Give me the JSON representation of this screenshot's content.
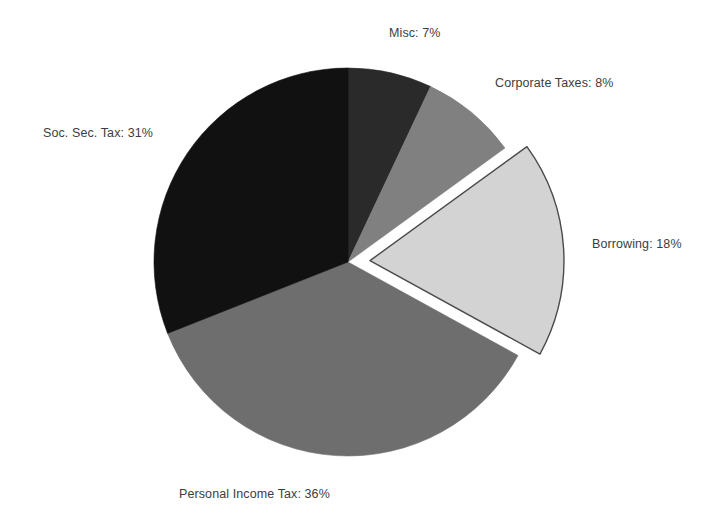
{
  "chart_data": {
    "type": "pie",
    "title": "",
    "xlabel": "",
    "ylabel": "",
    "legend_position": "none",
    "grid": false,
    "labels": [
      "Misc",
      "Corporate Taxes",
      "Borrowing",
      "Personal Income Tax",
      "Soc. Sec. Tax"
    ],
    "values": [
      7,
      8,
      18,
      36,
      31
    ],
    "unit": "%",
    "start_angle_deg": 0,
    "direction": "clockwise",
    "exploded_slices": [
      "Borrowing"
    ],
    "colors": [
      "#2a2a2a",
      "#808080",
      "#d3d3d3",
      "#6e6e6e",
      "#111111"
    ],
    "slices": [
      {
        "name": "Misc",
        "value": 7,
        "label": "Misc: 7%",
        "color": "#2a2a2a",
        "exploded": false
      },
      {
        "name": "Corporate Taxes",
        "value": 8,
        "label": "Corporate Taxes: 8%",
        "color": "#808080",
        "exploded": false
      },
      {
        "name": "Borrowing",
        "value": 18,
        "label": "Borrowing: 18%",
        "color": "#d3d3d3",
        "exploded": true
      },
      {
        "name": "Personal Income Tax",
        "value": 36,
        "label": "Personal Income Tax: 36%",
        "color": "#6e6e6e",
        "exploded": false
      },
      {
        "name": "Soc. Sec. Tax",
        "value": 31,
        "label": "Soc. Sec. Tax: 31%",
        "color": "#111111",
        "exploded": false
      }
    ]
  },
  "labels": {
    "misc": "Misc: 7%",
    "corporate": "Corporate Taxes: 8%",
    "borrowing": "Borrowing: 18%",
    "personal": "Personal Income Tax: 36%",
    "socsec": "Soc. Sec. Tax: 31%"
  },
  "geometry": {
    "center_x": 348,
    "center_y": 262,
    "radius": 194,
    "explode_offset": 22
  },
  "style": {
    "background": "#ffffff",
    "label_color": "#3d3d3d",
    "slice_outline": "#4a4a4a"
  }
}
